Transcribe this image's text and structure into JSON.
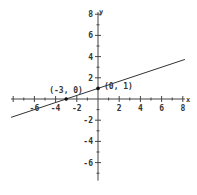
{
  "chart_data": {
    "type": "line",
    "title": "",
    "xlabel": "x",
    "ylabel": "y",
    "xlim": [
      -8.2,
      8.2
    ],
    "ylim": [
      -7.7,
      8.2
    ],
    "x_ticks": [
      -6,
      -4,
      -2,
      2,
      4,
      6,
      8
    ],
    "y_ticks": [
      8,
      6,
      4,
      2,
      -2,
      -4,
      -6
    ],
    "minor_tick_step": 1,
    "grid": false,
    "series": [
      {
        "name": "y = x/3 + 1",
        "x": [
          -8.2,
          8.2
        ],
        "y": [
          -1.733,
          3.733
        ],
        "color": "#333333"
      }
    ],
    "points": [
      {
        "x": -3,
        "y": 0,
        "label": "(-3, 0)"
      },
      {
        "x": 0,
        "y": 1,
        "label": "(0, 1)"
      }
    ]
  },
  "colors": {
    "axis": "#444444",
    "line": "#333333",
    "text": "#333333",
    "background": "#ffffff"
  }
}
